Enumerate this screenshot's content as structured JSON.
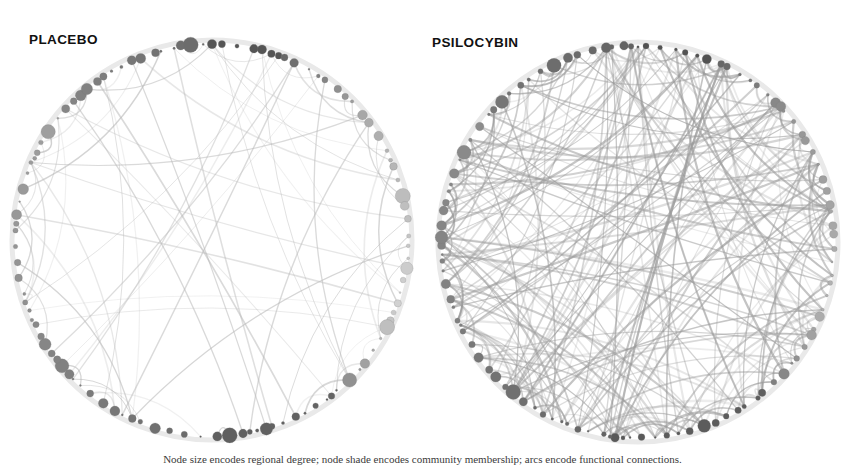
{
  "figure": {
    "background_color": "#ffffff",
    "width": 845,
    "height": 465
  },
  "panels": [
    {
      "id": "placebo",
      "label": "PLACEBO",
      "label_color": "#111111",
      "center_x": 212,
      "center_y": 240,
      "radius": 196,
      "node_count": 108,
      "edge_count": 78,
      "edge_color": "#b9b9b9",
      "edge_opacity": 0.55,
      "density_description": "sparse"
    },
    {
      "id": "psilocybin",
      "label": "PSILOCYBIN",
      "label_color": "#111111",
      "center_x": 638,
      "center_y": 242,
      "radius": 196,
      "node_count": 108,
      "edge_count": 300,
      "edge_color": "#9a9a9a",
      "edge_opacity": 0.5,
      "density_description": "dense"
    }
  ],
  "node_palette": {
    "dark": "#4f4f4f",
    "mid_dark": "#6e6e6e",
    "mid": "#949494",
    "mid_light": "#b0b0b0",
    "light": "#d2d2d2",
    "very_light": "#e3e3e3",
    "stroke": "#7a7a7a"
  },
  "legend_note": "Node size encodes regional degree; node shade encodes community membership; arcs encode functional connections.",
  "chart_data": {
    "type": "network",
    "layout": "circular",
    "series": [
      {
        "name": "PLACEBO",
        "edges": 78,
        "nodes": 108,
        "description": "Low edge density; most connections concentrated between neighbouring nodes on the ring."
      },
      {
        "name": "PSILOCYBIN",
        "edges": 300,
        "nodes": 108,
        "description": "High edge density; many long-range chords crossing the interior of the ring."
      }
    ]
  }
}
